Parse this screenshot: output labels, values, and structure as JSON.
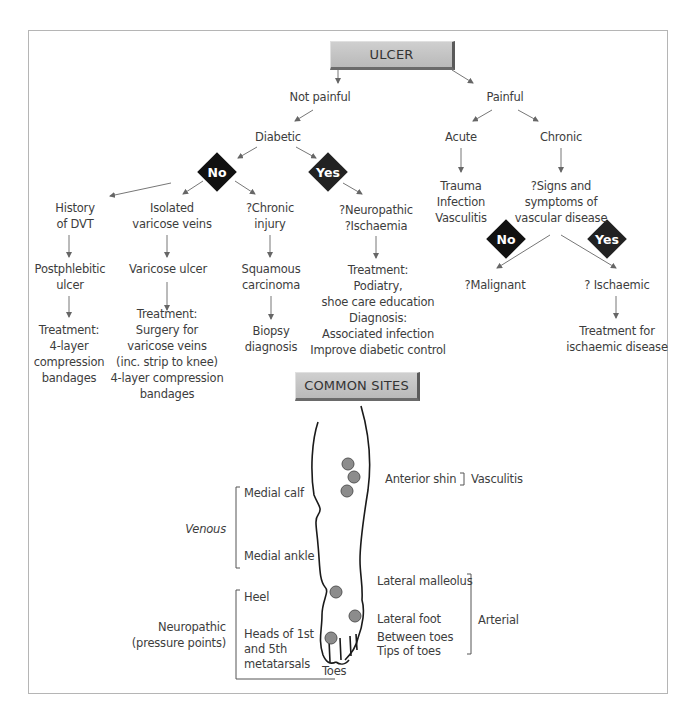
{
  "title": "ULCER",
  "flow": {
    "not_painful": "Not painful",
    "painful": "Painful",
    "diabetic": "Diabetic",
    "no_label": "No",
    "yes_label": "Yes",
    "acute": "Acute",
    "chronic": "Chronic",
    "acute_causes": [
      "Trauma",
      "Infection",
      "Vasculitis"
    ],
    "signs": [
      "?Signs and",
      "symptoms of",
      "vascular disease"
    ],
    "malignant": "?Malignant",
    "ischaemic": "? Ischaemic",
    "ischaemic_treatment": [
      "Treatment for",
      "ischaemic disease"
    ],
    "dvt": {
      "title": [
        "History",
        "of DVT"
      ],
      "result": [
        "Postphlebitic",
        "ulcer"
      ],
      "treatment": [
        "Treatment:",
        "4-layer",
        "compression",
        "bandages"
      ]
    },
    "varicose": {
      "title": [
        "Isolated",
        "varicose veins"
      ],
      "result": [
        "Varicose ulcer"
      ],
      "treatment": [
        "Treatment:",
        "Surgery for",
        "varicose veins",
        "(inc. strip to knee)",
        "4-layer compression",
        "bandages"
      ]
    },
    "chronic_injury": {
      "title": [
        "?Chronic",
        "injury"
      ],
      "result": [
        "Squamous",
        "carcinoma"
      ],
      "treatment": [
        "Biopsy",
        "diagnosis"
      ]
    },
    "neuropathic": {
      "title": [
        "?Neuropathic",
        "?Ischaemia"
      ],
      "treatment": [
        "Treatment:",
        "Podiatry,",
        "shoe care education",
        "Diagnosis:",
        "Associated infection",
        "Improve diabetic control"
      ]
    }
  },
  "sites": {
    "title": "COMMON SITES",
    "venous": "Venous",
    "venous_sites": [
      "Medial calf",
      "Medial ankle"
    ],
    "neuropathic": [
      "Neuropathic",
      "(pressure points)"
    ],
    "neuro_sites": [
      "Heel",
      "Heads of 1st",
      "and 5th",
      "metatarsals"
    ],
    "toes": "Toes",
    "anterior_shin": "Anterior shin",
    "vasculitis": "Vasculitis",
    "arterial": "Arterial",
    "arterial_sites": [
      "Lateral malleolus",
      "Lateral foot",
      "Between toes",
      "Tips of toes"
    ]
  },
  "colors": {
    "diamond": "#111111",
    "box": "#c4c4c4",
    "dot": "#8a8a8a",
    "text": "#3d3d3d"
  }
}
